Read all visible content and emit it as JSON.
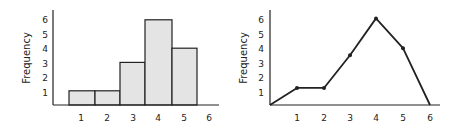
{
  "chart_data": [
    {
      "type": "bar",
      "subtype": "histogram",
      "title": "",
      "xlabel": "",
      "ylabel": "Frequency",
      "categories": [
        "1",
        "2",
        "3",
        "4",
        "5"
      ],
      "values": [
        1,
        1,
        3,
        6,
        4
      ],
      "x_ticks": [
        "1",
        "2",
        "3",
        "4",
        "5",
        "6"
      ],
      "y_ticks": [
        "1",
        "2",
        "3",
        "4",
        "5",
        "6"
      ],
      "ylim": [
        0,
        6.5
      ],
      "grid": false,
      "bar_fill": "#e4e4e4",
      "bar_stroke": "#222222"
    },
    {
      "type": "line",
      "subtype": "frequency-polygon",
      "title": "",
      "xlabel": "",
      "ylabel": "Frequency",
      "x": [
        0,
        1,
        2,
        3,
        4,
        5,
        6
      ],
      "values": [
        0,
        1.2,
        1.2,
        3.5,
        6.1,
        4,
        0
      ],
      "x_ticks": [
        "1",
        "2",
        "3",
        "4",
        "5",
        "6"
      ],
      "y_ticks": [
        "1",
        "2",
        "3",
        "4",
        "5",
        "6"
      ],
      "ylim": [
        0,
        6.5
      ],
      "grid": false,
      "line_color": "#222222",
      "markers": true
    }
  ]
}
